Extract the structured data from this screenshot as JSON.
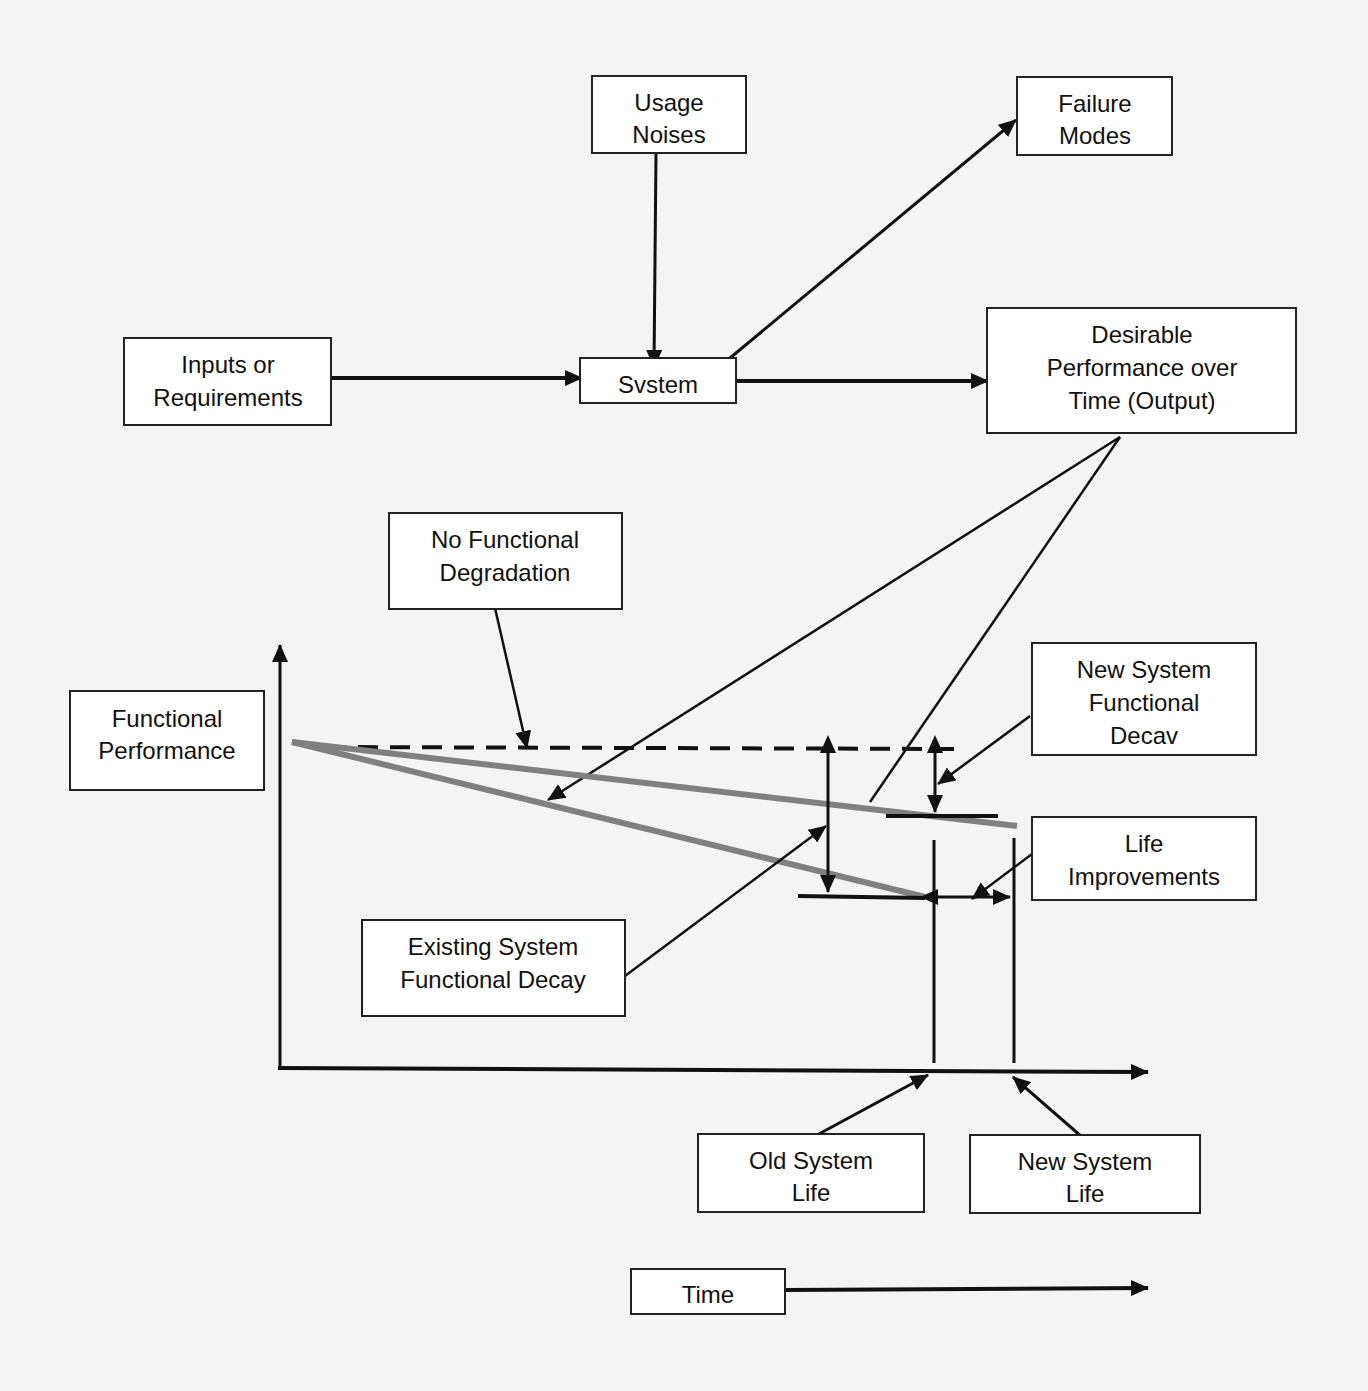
{
  "figure": {
    "type": "lifecycle functional performance diagram",
    "boxes": {
      "usage_noises": {
        "line1": "Usage",
        "line2": "Noises"
      },
      "failure_modes": {
        "line1": "Failure",
        "line2": "Modes"
      },
      "inputs": {
        "line1": "Inputs or",
        "line2": "Requirements"
      },
      "system": {
        "line1": "Svstem"
      },
      "desirable_output": {
        "line1": "Desirable",
        "line2": "Performance over",
        "line3": "Time (Output)"
      },
      "no_degradation": {
        "line1": "No Functional",
        "line2": "Degradation"
      },
      "functional_performance": {
        "line1": "Functional",
        "line2": "Performance"
      },
      "new_decay": {
        "line1": "New  System",
        "line2": "Functional",
        "line3": "Decav"
      },
      "life_improvements": {
        "line1": "Life",
        "line2": "Improvements"
      },
      "existing_decay": {
        "line1": "Existing System",
        "line2": "Functional Decay"
      },
      "old_life": {
        "line1": "Old System",
        "line2": "Life"
      },
      "new_life": {
        "line1": "New System",
        "line2": "Life"
      },
      "time": {
        "line1": "Time"
      }
    },
    "colors": {
      "line": "#111111",
      "decay_curve": "#808080",
      "background": "#f4f4f4",
      "bleed_text": "#d6d6d6"
    }
  }
}
